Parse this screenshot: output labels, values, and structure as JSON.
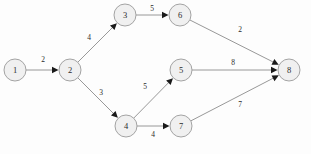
{
  "diagram": {
    "type": "directed-graph",
    "canvas": {
      "width": 311,
      "height": 154,
      "background": "#fdfdfd"
    },
    "style": {
      "node_fill": "#f0f0f0",
      "node_stroke": "#9a9a9a",
      "edge_stroke": "#8c8c8c",
      "arrow_fill": "#1a1a1a",
      "text_color": "#2b2b2b",
      "node_radius": 11
    },
    "nodes": [
      {
        "id": "1",
        "label": "1",
        "x": 15,
        "y": 70
      },
      {
        "id": "2",
        "label": "2",
        "x": 70,
        "y": 70
      },
      {
        "id": "3",
        "label": "3",
        "x": 125,
        "y": 15
      },
      {
        "id": "4",
        "label": "4",
        "x": 126,
        "y": 126
      },
      {
        "id": "5",
        "label": "5",
        "x": 181,
        "y": 70
      },
      {
        "id": "6",
        "label": "6",
        "x": 180,
        "y": 15
      },
      {
        "id": "7",
        "label": "7",
        "x": 181,
        "y": 126
      },
      {
        "id": "8",
        "label": "8",
        "x": 289,
        "y": 70
      }
    ],
    "edges": [
      {
        "id": "e1-2",
        "from": "1",
        "to": "2",
        "weight": "2",
        "label_x": 43,
        "label_y": 59
      },
      {
        "id": "e2-3",
        "from": "2",
        "to": "3",
        "weight": "4",
        "label_x": 89,
        "label_y": 37
      },
      {
        "id": "e2-4",
        "from": "2",
        "to": "4",
        "weight": "3",
        "label_x": 101,
        "label_y": 92
      },
      {
        "id": "e3-6",
        "from": "3",
        "to": "6",
        "weight": "5",
        "label_x": 152,
        "label_y": 8
      },
      {
        "id": "e4-5",
        "from": "4",
        "to": "5",
        "weight": "5",
        "label_x": 145,
        "label_y": 86
      },
      {
        "id": "e4-7",
        "from": "4",
        "to": "7",
        "weight": "4",
        "label_x": 153,
        "label_y": 134
      },
      {
        "id": "e6-8",
        "from": "6",
        "to": "8",
        "weight": "2",
        "label_x": 240,
        "label_y": 29
      },
      {
        "id": "e5-8",
        "from": "5",
        "to": "8",
        "weight": "8",
        "label_x": 233,
        "label_y": 62
      },
      {
        "id": "e7-8",
        "from": "7",
        "to": "8",
        "weight": "7",
        "label_x": 240,
        "label_y": 104
      }
    ]
  }
}
